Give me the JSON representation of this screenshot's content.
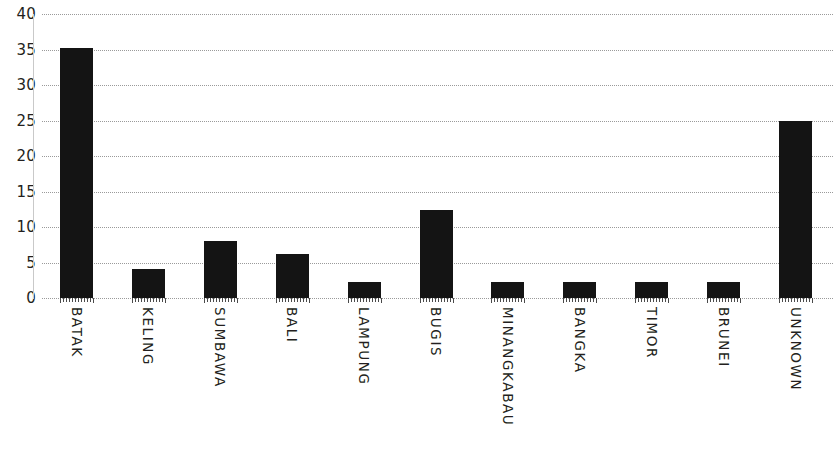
{
  "chart_data": {
    "type": "bar",
    "title": "",
    "subtitle": "",
    "xlabel": "",
    "ylabel": "",
    "ylim": [
      0,
      40
    ],
    "yticks": [
      0,
      5,
      10,
      15,
      20,
      25,
      30,
      35,
      40
    ],
    "ytick_labels": [
      "0",
      "5",
      "10",
      "15",
      "20",
      "25",
      "30",
      "35",
      "40"
    ],
    "grid": "horizontal-dotted",
    "legend": "none",
    "bar_color": "#141414",
    "gridline_color": "#9a9a9a",
    "axis_color": "#c9c9c9",
    "text_color": "#231f20",
    "categories": [
      "BATAK",
      "KELING",
      "SUMBAWA",
      "BALI",
      "LAMPUNG",
      "BUGIS",
      "MINANGKABAU",
      "BANGKA",
      "TIMOR",
      "BRUNEI",
      "UNKNOWN"
    ],
    "values": [
      35.2,
      4.1,
      8.1,
      6.2,
      2.2,
      12.4,
      2.2,
      2.2,
      2.2,
      2.2,
      25.0
    ]
  }
}
